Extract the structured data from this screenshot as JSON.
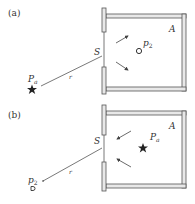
{
  "figure": {
    "panels": [
      {
        "id": "a",
        "label": "(a)",
        "slit_label": "S",
        "room_label": "A",
        "source_label": "P",
        "source_sub": "a",
        "receiver_label": "p",
        "receiver_sub": "2",
        "distance_label": "r",
        "source_location": "outside",
        "receiver_location": "inside"
      },
      {
        "id": "b",
        "label": "(b)",
        "slit_label": "S",
        "room_label": "A",
        "source_label": "P",
        "source_sub": "a",
        "receiver_label": "p",
        "receiver_sub": "2",
        "distance_label": "r",
        "source_location": "inside",
        "receiver_location": "outside"
      }
    ],
    "colors": {
      "ink": "#333333",
      "wall_fill": "#e8e8e8"
    }
  }
}
